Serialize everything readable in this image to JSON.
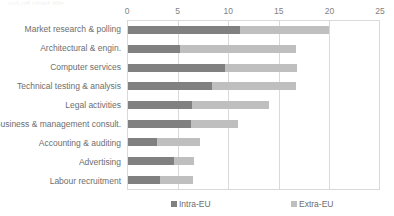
{
  "chart_data": {
    "type": "bar",
    "orientation": "horizontal",
    "stacked": true,
    "title": "",
    "xlabel": "",
    "ylabel": "",
    "xlim": [
      0,
      25
    ],
    "xticks": [
      "0",
      "5",
      "10",
      "15",
      "20",
      "25"
    ],
    "xtick_values": [
      0,
      5,
      10,
      15,
      20,
      25
    ],
    "grid": true,
    "legend_position": "bottom",
    "categories": [
      "Market research & polling",
      "Architectural & engin.",
      "Computer services",
      "Technical testing & analysis",
      "Legal activities",
      "Business & management consult.",
      "Accounting & auditing",
      "Advertising",
      "Labour recruitment"
    ],
    "series": [
      {
        "name": "Intra-EU",
        "color": "#808080",
        "values": [
          11.2,
          5.2,
          9.7,
          8.4,
          6.4,
          6.3,
          2.9,
          4.6,
          3.2
        ]
      },
      {
        "name": "Extra-EU",
        "color": "#bfbfbf",
        "values": [
          8.8,
          11.5,
          7.1,
          8.3,
          7.6,
          4.7,
          4.3,
          2.0,
          3.3
        ]
      }
    ],
    "totals": [
      20.0,
      16.7,
      16.8,
      16.7,
      14.0,
      11.0,
      7.2,
      6.6,
      6.5
    ]
  },
  "legend": {
    "items": [
      {
        "label": "Intra-EU",
        "color": "#808080"
      },
      {
        "label": "Extra-EU",
        "color": "#bfbfbf"
      }
    ]
  },
  "title_remnant": {
    "text": "cut-off chart title"
  }
}
